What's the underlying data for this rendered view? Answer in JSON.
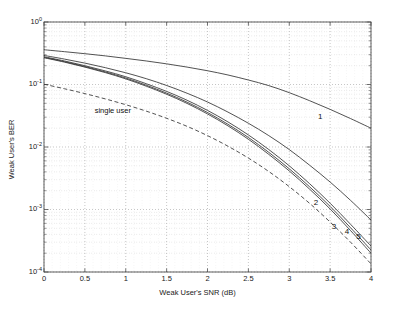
{
  "chart_data": {
    "type": "line",
    "title": "",
    "xlabel": "Weak User's  SNR (dB)",
    "ylabel": "Weak User's BER",
    "xlim": [
      0,
      4
    ],
    "ylim": [
      0.0001,
      1
    ],
    "yscale": "log",
    "xscale": "linear",
    "grid": true,
    "grid_style": "dotted",
    "legend_position": "inline-annotations",
    "xticks": [
      "0",
      "0.5",
      "1",
      "1.5",
      "2",
      "2.5",
      "3",
      "3.5",
      "4"
    ],
    "xtick_values": [
      0,
      0.5,
      1,
      1.5,
      2,
      2.5,
      3,
      3.5,
      4
    ],
    "ytick_labels": [
      "10^0",
      "10^-1",
      "10^-2",
      "10^-3",
      "10^-4"
    ],
    "ytick_exponents": [
      "0",
      "-1",
      "-2",
      "-3",
      "-4"
    ],
    "ytick_values": [
      1,
      0.1,
      0.01,
      0.001,
      0.0001
    ],
    "annotations": [
      {
        "text": "single user",
        "x": 0.62,
        "y": 0.038
      },
      {
        "text": "1",
        "x": 3.35,
        "y": 0.0305
      },
      {
        "text": "2",
        "x": 3.3,
        "y": 0.00128
      },
      {
        "text": "3",
        "x": 3.52,
        "y": 0.00053
      },
      {
        "text": "4",
        "x": 3.68,
        "y": 0.00043
      },
      {
        "text": "5",
        "x": 3.82,
        "y": 0.00037
      }
    ],
    "series": [
      {
        "name": "1",
        "style": "solid",
        "color": "#333333",
        "x": [
          0,
          0.25,
          0.5,
          0.75,
          1,
          1.25,
          1.5,
          1.75,
          2,
          2.25,
          2.5,
          2.75,
          3,
          3.25,
          3.5,
          3.75,
          4
        ],
        "y": [
          0.36,
          0.335,
          0.311,
          0.287,
          0.262,
          0.238,
          0.214,
          0.19,
          0.166,
          0.142,
          0.118,
          0.096,
          0.074,
          0.055,
          0.04,
          0.0285,
          0.02
        ]
      },
      {
        "name": "2",
        "style": "solid",
        "color": "#333333",
        "x": [
          0,
          0.25,
          0.5,
          0.75,
          1,
          1.25,
          1.5,
          1.75,
          2,
          2.25,
          2.5,
          2.75,
          3,
          3.25,
          3.5,
          3.75,
          4
        ],
        "y": [
          0.292,
          0.255,
          0.22,
          0.186,
          0.154,
          0.124,
          0.0965,
          0.0725,
          0.0525,
          0.0362,
          0.024,
          0.0152,
          0.0091,
          0.0051,
          0.00275,
          0.0014,
          0.00068
        ]
      },
      {
        "name": "3",
        "style": "solid",
        "color": "#333333",
        "x": [
          0,
          0.25,
          0.5,
          0.75,
          1,
          1.25,
          1.5,
          1.75,
          2,
          2.25,
          2.5,
          2.75,
          3,
          3.25,
          3.5,
          3.75,
          4
        ],
        "y": [
          0.278,
          0.238,
          0.2,
          0.165,
          0.133,
          0.103,
          0.0775,
          0.056,
          0.0385,
          0.0252,
          0.0156,
          0.0091,
          0.005,
          0.00258,
          0.00126,
          0.00058,
          0.00026
        ]
      },
      {
        "name": "4",
        "style": "solid",
        "color": "#333333",
        "x": [
          0,
          0.25,
          0.5,
          0.75,
          1,
          1.25,
          1.5,
          1.75,
          2,
          2.25,
          2.5,
          2.75,
          3,
          3.25,
          3.5,
          3.75,
          4
        ],
        "y": [
          0.272,
          0.232,
          0.194,
          0.159,
          0.127,
          0.0975,
          0.0728,
          0.0522,
          0.0356,
          0.0231,
          0.0142,
          0.0082,
          0.00448,
          0.0023,
          0.00112,
          0.00051,
          0.000225
        ]
      },
      {
        "name": "5",
        "style": "solid",
        "color": "#333333",
        "x": [
          0,
          0.25,
          0.5,
          0.75,
          1,
          1.25,
          1.5,
          1.75,
          2,
          2.25,
          2.5,
          2.75,
          3,
          3.25,
          3.5,
          3.75,
          4
        ],
        "y": [
          0.268,
          0.228,
          0.19,
          0.155,
          0.123,
          0.094,
          0.0698,
          0.0498,
          0.0338,
          0.0218,
          0.0133,
          0.00762,
          0.00414,
          0.00211,
          0.00102,
          0.00046,
          0.0002
        ]
      },
      {
        "name": "single user",
        "style": "dashed",
        "color": "#333333",
        "x": [
          0,
          0.25,
          0.5,
          0.75,
          1,
          1.25,
          1.5,
          1.75,
          2,
          2.25,
          2.5,
          2.75,
          3,
          3.25,
          3.5,
          3.75,
          4
        ],
        "y": [
          0.101,
          0.0855,
          0.0715,
          0.0588,
          0.0475,
          0.0375,
          0.0288,
          0.0214,
          0.0152,
          0.0103,
          0.00665,
          0.00405,
          0.00232,
          0.00125,
          0.00063,
          0.0003,
          0.000135
        ]
      }
    ]
  }
}
